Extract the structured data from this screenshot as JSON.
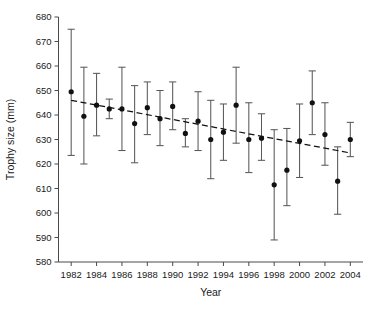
{
  "chart_data": {
    "type": "scatter",
    "title": "",
    "xlabel": "Year",
    "ylabel": "Trophy size (mm)",
    "xlim": [
      1981,
      2005
    ],
    "ylim": [
      580,
      680
    ],
    "xticks": [
      1982,
      1984,
      1986,
      1988,
      1990,
      1992,
      1994,
      1996,
      1998,
      2000,
      2002,
      2004
    ],
    "yticks": [
      580,
      590,
      600,
      610,
      620,
      630,
      640,
      650,
      660,
      670,
      680
    ],
    "grid": false,
    "legend": null,
    "error_bars": "vertical, capped, 95% CI style",
    "x": [
      1982,
      1983,
      1984,
      1985,
      1986,
      1987,
      1988,
      1989,
      1990,
      1991,
      1992,
      1993,
      1994,
      1995,
      1996,
      1997,
      1998,
      1999,
      2000,
      2001,
      2002,
      2003,
      2004
    ],
    "values": [
      649.5,
      639.5,
      644.0,
      642.5,
      642.5,
      636.5,
      643.0,
      638.5,
      643.5,
      632.5,
      637.5,
      630.0,
      633.0,
      644.0,
      630.0,
      630.5,
      611.5,
      617.5,
      629.5,
      645.0,
      632.0,
      613.0,
      630.0
    ],
    "series": [
      {
        "name": "Mean trophy size",
        "points": [
          {
            "year": 1982,
            "mean": 649.5,
            "lower": 623.5,
            "upper": 675.0
          },
          {
            "year": 1983,
            "mean": 639.5,
            "lower": 620.0,
            "upper": 659.5
          },
          {
            "year": 1984,
            "mean": 644.0,
            "lower": 631.5,
            "upper": 657.0
          },
          {
            "year": 1985,
            "mean": 642.5,
            "lower": 638.5,
            "upper": 646.5
          },
          {
            "year": 1986,
            "mean": 642.5,
            "lower": 625.5,
            "upper": 659.5
          },
          {
            "year": 1987,
            "mean": 636.5,
            "lower": 620.5,
            "upper": 652.0
          },
          {
            "year": 1988,
            "mean": 643.0,
            "lower": 632.0,
            "upper": 653.5
          },
          {
            "year": 1989,
            "mean": 638.5,
            "lower": 627.5,
            "upper": 650.0
          },
          {
            "year": 1990,
            "mean": 643.5,
            "lower": 634.0,
            "upper": 653.5
          },
          {
            "year": 1991,
            "mean": 632.5,
            "lower": 627.0,
            "upper": 638.5
          },
          {
            "year": 1992,
            "mean": 637.5,
            "lower": 625.5,
            "upper": 649.5
          },
          {
            "year": 1993,
            "mean": 630.0,
            "lower": 614.0,
            "upper": 646.0
          },
          {
            "year": 1994,
            "mean": 633.0,
            "lower": 621.5,
            "upper": 644.5
          },
          {
            "year": 1995,
            "mean": 644.0,
            "lower": 628.5,
            "upper": 659.5
          },
          {
            "year": 1996,
            "mean": 630.0,
            "lower": 616.5,
            "upper": 645.0
          },
          {
            "year": 1997,
            "mean": 630.5,
            "lower": 621.5,
            "upper": 640.5
          },
          {
            "year": 1998,
            "mean": 611.5,
            "lower": 589.0,
            "upper": 634.0
          },
          {
            "year": 1999,
            "mean": 617.5,
            "lower": 603.0,
            "upper": 634.5
          },
          {
            "year": 2000,
            "mean": 629.5,
            "lower": 614.5,
            "upper": 644.5
          },
          {
            "year": 2001,
            "mean": 645.0,
            "lower": 632.0,
            "upper": 658.0
          },
          {
            "year": 2002,
            "mean": 632.0,
            "lower": 619.5,
            "upper": 645.0
          },
          {
            "year": 2003,
            "mean": 613.0,
            "lower": 599.5,
            "upper": 627.0
          },
          {
            "year": 2004,
            "mean": 630.0,
            "lower": 623.0,
            "upper": 637.0
          }
        ]
      }
    ],
    "trendline": {
      "style": "dashed",
      "x_start": 1982,
      "y_start": 646.0,
      "x_end": 2004,
      "y_end": 624.5
    }
  }
}
